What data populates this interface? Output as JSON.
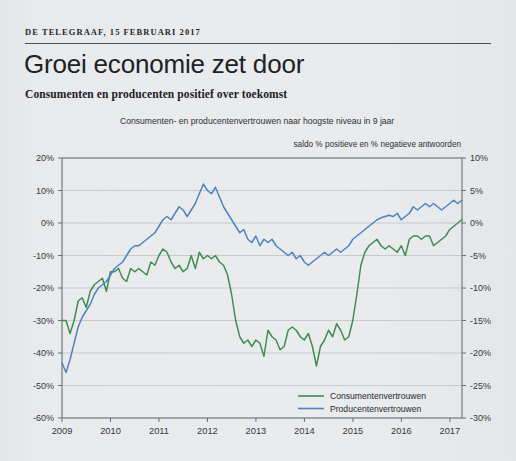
{
  "publication": {
    "kicker": "DE TELEGRAAF, 15 FEBRUARI 2017"
  },
  "headline": "Groei economie zet door",
  "subhead": "Consumenten en producenten positief over toekomst",
  "colors": {
    "consumer_green": "#3c8c4e",
    "producer_blue": "#4b82c0",
    "background": "#e8eaec",
    "grid": "#b9bdc1",
    "axis": "#5d6266",
    "text": "#1d2226"
  },
  "chart_data": {
    "type": "line",
    "title": "Consumenten- en producentenvertrouwen naar hoogste niveau in 9 jaar",
    "subtitle": "saldo % positieve en % negatieve antwoorden",
    "xlabel": "",
    "ylabel": "",
    "grid": true,
    "legend_position": "bottom-right",
    "x_ticks": [
      "2009",
      "2010",
      "2011",
      "2012",
      "2013",
      "2014",
      "2015",
      "2016",
      "2017"
    ],
    "x_range": [
      2009.0,
      2017.25
    ],
    "left_axis": {
      "label": "Consumentenvertrouwen",
      "ticks": [
        "20%",
        "10%",
        "0%",
        "-10%",
        "-20%",
        "-30%",
        "-40%",
        "-50%",
        "-60%"
      ],
      "tick_values": [
        20,
        10,
        0,
        -10,
        -20,
        -30,
        -40,
        -50,
        -60
      ],
      "ylim": [
        -60,
        20
      ]
    },
    "right_axis": {
      "label": "Producentenvertrouwen",
      "ticks": [
        "10%",
        "5%",
        "0%",
        "-5%",
        "-10%",
        "-15%",
        "-20%",
        "-25%",
        "-30%"
      ],
      "tick_values": [
        10,
        5,
        0,
        -5,
        -10,
        -15,
        -20,
        -25,
        -30
      ],
      "ylim": [
        -30,
        10
      ]
    },
    "series": [
      {
        "name": "Consumentenvertrouwen",
        "color": "#3c8c4e",
        "axis": "left",
        "unit": "%",
        "x_start": 2009.0,
        "x_step": 0.0833,
        "values": [
          -30,
          -30,
          -34,
          -30,
          -24,
          -23,
          -26,
          -21,
          -19,
          -18,
          -17,
          -21,
          -15,
          -15,
          -14,
          -17,
          -18,
          -14,
          -15,
          -14,
          -15,
          -16,
          -12,
          -13,
          -10,
          -8,
          -9,
          -12,
          -14,
          -13,
          -15,
          -14,
          -10,
          -14,
          -9,
          -11,
          -10,
          -11,
          -10,
          -12,
          -13,
          -16,
          -22,
          -30,
          -35,
          -37,
          -36,
          -38,
          -36,
          -37,
          -41,
          -33,
          -35,
          -36,
          -39,
          -38,
          -33,
          -32,
          -33,
          -35,
          -36,
          -34,
          -38,
          -44,
          -38,
          -36,
          -33,
          -35,
          -31,
          -33,
          -36,
          -35,
          -30,
          -22,
          -13,
          -9,
          -7,
          -6,
          -5,
          -7,
          -8,
          -7,
          -8,
          -9,
          -7,
          -10,
          -5,
          -4,
          -4,
          -5,
          -4,
          -4,
          -7,
          -6,
          -5,
          -4,
          -2,
          -1,
          0,
          1,
          0,
          -1,
          -3,
          -8,
          -5,
          -2,
          -3,
          -1,
          0,
          2,
          4,
          7,
          10,
          12,
          13,
          14
        ]
      },
      {
        "name": "Producentenvertrouwen",
        "color": "#4b82c0",
        "axis": "left_mapped",
        "unit": "%",
        "note": "plotted against right axis; values below are right-axis percentages",
        "x_start": 2009.0,
        "x_step": 0.0833,
        "values": [
          -21.5,
          -23.0,
          -21.0,
          -18.5,
          -16.0,
          -14.5,
          -13.5,
          -12.5,
          -11.0,
          -10.0,
          -9.5,
          -9.0,
          -8.0,
          -7.0,
          -6.5,
          -6.0,
          -5.0,
          -4.0,
          -3.5,
          -3.5,
          -3.0,
          -2.5,
          -2.0,
          -1.5,
          -0.5,
          0.5,
          1.0,
          0.5,
          1.5,
          2.5,
          2.0,
          1.0,
          2.0,
          3.0,
          4.5,
          6.0,
          5.0,
          4.5,
          5.5,
          4.0,
          2.5,
          1.5,
          0.5,
          -0.5,
          -1.5,
          -1.0,
          -2.5,
          -3.0,
          -2.0,
          -3.5,
          -2.5,
          -3.0,
          -2.5,
          -3.5,
          -4.0,
          -4.5,
          -5.0,
          -4.5,
          -5.5,
          -5.0,
          -6.0,
          -6.5,
          -6.0,
          -5.5,
          -5.0,
          -4.5,
          -5.0,
          -4.5,
          -4.0,
          -4.5,
          -4.0,
          -3.5,
          -2.5,
          -2.0,
          -1.5,
          -1.0,
          -0.5,
          0.0,
          0.5,
          0.8,
          1.0,
          1.2,
          1.0,
          1.5,
          0.5,
          1.0,
          1.5,
          2.5,
          2.0,
          2.5,
          3.0,
          2.5,
          3.0,
          2.5,
          2.0,
          2.5,
          3.0,
          3.5,
          3.0,
          3.5,
          4.0,
          3.5,
          3.0,
          2.0,
          3.0,
          4.0,
          3.5,
          4.0,
          4.5,
          5.0,
          5.5,
          5.0,
          5.5,
          6.0,
          6.5,
          7.0
        ]
      }
    ]
  },
  "legend": [
    {
      "label": "Consumentenvertrouwen",
      "color": "#3c8c4e"
    },
    {
      "label": "Producentenvertrouwen",
      "color": "#4b82c0"
    }
  ]
}
